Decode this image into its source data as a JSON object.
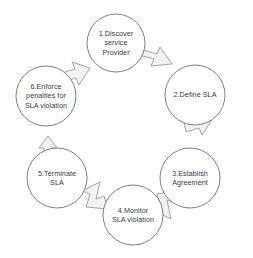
{
  "diagram": {
    "type": "cycle-diagram",
    "direction": "clockwise",
    "colors": {
      "background": "#ffffff",
      "circle_stroke": "#7f7f7f",
      "circle_fill": "#ffffff",
      "arrow_fill": "#f2f2f2",
      "arrow_stroke": "#9a9a9a",
      "text": "#3b3b3b"
    },
    "nodes": [
      {
        "id": "node-1",
        "number": "1",
        "label": "1.Discover\nservice\nProvider",
        "cx": 116,
        "cy": 43,
        "r": 29
      },
      {
        "id": "node-2",
        "number": "2",
        "label": "2.Define SLA",
        "cx": 195,
        "cy": 95,
        "r": 30
      },
      {
        "id": "node-3",
        "number": "3",
        "label": "3.Establish\nAgreement",
        "cx": 190,
        "cy": 178,
        "r": 30
      },
      {
        "id": "node-4",
        "number": "4",
        "label": "4.Monitor\nSLA violation",
        "cx": 133,
        "cy": 215,
        "r": 30
      },
      {
        "id": "node-5",
        "number": "5",
        "label": "5.Terminate\nSLA",
        "cx": 57,
        "cy": 178,
        "r": 30
      },
      {
        "id": "node-6",
        "number": "6",
        "label": "6.Enforce\npenalties for\nSLA violation",
        "cx": 46,
        "cy": 96,
        "r": 30
      }
    ],
    "arrows": [
      {
        "id": "arrow-1-2",
        "from": "node-1",
        "to": "node-2",
        "direction": "down-right"
      },
      {
        "id": "arrow-2-3",
        "from": "node-2",
        "to": "node-3",
        "direction": "down-right"
      },
      {
        "id": "arrow-3-4",
        "from": "node-3",
        "to": "node-4",
        "direction": "down-left"
      },
      {
        "id": "arrow-4-5",
        "from": "node-4",
        "to": "node-5",
        "direction": "up-left"
      },
      {
        "id": "arrow-5-6",
        "from": "node-5",
        "to": "node-6",
        "direction": "up"
      },
      {
        "id": "arrow-6-1",
        "from": "node-6",
        "to": "node-1",
        "direction": "up-right"
      }
    ]
  }
}
